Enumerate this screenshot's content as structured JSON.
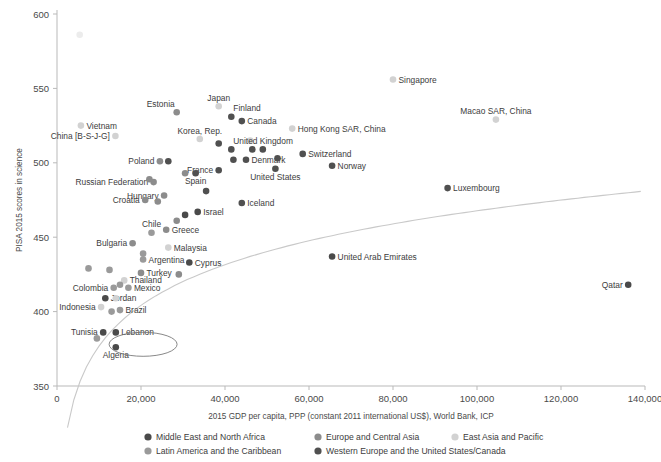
{
  "chart_data": {
    "type": "scatter",
    "title": "",
    "xlabel": "2015 GDP per capita, PPP (constant 2011 international US$), World Bank, ICP",
    "ylabel": "PISA 2015 scores in science",
    "xlim": [
      0,
      140000
    ],
    "ylim": [
      350,
      600
    ],
    "xticks": [
      "0",
      "20,000",
      "40,000",
      "60,000",
      "80,000",
      "100,000",
      "120,000",
      "140,000"
    ],
    "xtick_values": [
      0,
      20000,
      40000,
      60000,
      80000,
      100000,
      120000,
      140000
    ],
    "yticks": [
      "350",
      "400",
      "450",
      "500",
      "550",
      "600"
    ],
    "ytick_values": [
      350,
      400,
      450,
      500,
      550,
      600
    ],
    "grid": false,
    "legend_position": "bottom",
    "has_trendline": true,
    "trendline_note": "logarithmic fit curve rising from lower-left to upper-right",
    "annotation_ellipse": {
      "label": "Lebanon",
      "x": 20500,
      "y": 378
    },
    "series": [
      {
        "name": "Middle East and North Africa",
        "color": "#4a4a4a"
      },
      {
        "name": "Latin America and the Caribbean",
        "color": "#9a9a9a"
      },
      {
        "name": "Europe and Central Asia",
        "color": "#8c8c8c"
      },
      {
        "name": "Western Europe and the United States/Canada",
        "color": "#505050"
      },
      {
        "name": "East Asia and Pacific",
        "color": "#d2d2d2"
      }
    ],
    "points": [
      {
        "label": "",
        "x": 5400,
        "y": 586,
        "group": "East Asia and Pacific",
        "label_pos": "none"
      },
      {
        "label": "Singapore",
        "x": 80000,
        "y": 556,
        "group": "East Asia and Pacific",
        "label_pos": "right"
      },
      {
        "label": "Japan",
        "x": 38500,
        "y": 538,
        "group": "East Asia and Pacific",
        "label_pos": "above"
      },
      {
        "label": "Estonia",
        "x": 28500,
        "y": 534,
        "group": "Europe and Central Asia",
        "label_pos": "above-left"
      },
      {
        "label": "Finland",
        "x": 41500,
        "y": 531,
        "group": "Western Europe and the United States/Canada",
        "label_pos": "above-right"
      },
      {
        "label": "Macao SAR, China",
        "x": 104500,
        "y": 529,
        "group": "East Asia and Pacific",
        "label_pos": "above"
      },
      {
        "label": "Canada",
        "x": 44000,
        "y": 528,
        "group": "Western Europe and the United States/Canada",
        "label_pos": "right"
      },
      {
        "label": "Vietnam",
        "x": 5700,
        "y": 525,
        "group": "East Asia and Pacific",
        "label_pos": "right"
      },
      {
        "label": "Hong Kong SAR, China",
        "x": 56000,
        "y": 523,
        "group": "East Asia and Pacific",
        "label_pos": "right"
      },
      {
        "label": "China [B-S-J-G]",
        "x": 13900,
        "y": 518,
        "group": "East Asia and Pacific",
        "label_pos": "left"
      },
      {
        "label": "Korea, Rep.",
        "x": 34000,
        "y": 516,
        "group": "East Asia and Pacific",
        "label_pos": "above"
      },
      {
        "label": "Taipei",
        "x": 46000,
        "y": 515,
        "group": "East Asia and Pacific",
        "label_pos": "none"
      },
      {
        "label": "",
        "x": 38500,
        "y": 513,
        "group": "Western Europe and the United States/Canada",
        "label_pos": "none"
      },
      {
        "label": "United Kingdom",
        "x": 41500,
        "y": 509,
        "group": "Western Europe and the United States/Canada",
        "label_pos": "above-right"
      },
      {
        "label": "Switzerland",
        "x": 58500,
        "y": 506,
        "group": "Western Europe and the United States/Canada",
        "label_pos": "right"
      },
      {
        "label": "",
        "x": 46500,
        "y": 509,
        "group": "Western Europe and the United States/Canada",
        "label_pos": "none"
      },
      {
        "label": "",
        "x": 49000,
        "y": 509,
        "group": "Western Europe and the United States/Canada",
        "label_pos": "none"
      },
      {
        "label": "Poland",
        "x": 24500,
        "y": 501,
        "group": "Europe and Central Asia",
        "label_pos": "left"
      },
      {
        "label": "",
        "x": 26500,
        "y": 501,
        "group": "Western Europe and the United States/Canada",
        "label_pos": "none"
      },
      {
        "label": "Denmark",
        "x": 45000,
        "y": 502,
        "group": "Western Europe and the United States/Canada",
        "label_pos": "right"
      },
      {
        "label": "",
        "x": 42000,
        "y": 502,
        "group": "Western Europe and the United States/Canada",
        "label_pos": "none"
      },
      {
        "label": "",
        "x": 52500,
        "y": 503,
        "group": "Western Europe and the United States/Canada",
        "label_pos": "none"
      },
      {
        "label": "Norway",
        "x": 65500,
        "y": 498,
        "group": "Western Europe and the United States/Canada",
        "label_pos": "right"
      },
      {
        "label": "France",
        "x": 38500,
        "y": 495,
        "group": "Western Europe and the United States/Canada",
        "label_pos": "left"
      },
      {
        "label": "United States",
        "x": 52000,
        "y": 496,
        "group": "Western Europe and the United States/Canada",
        "label_pos": "below"
      },
      {
        "label": "Spain",
        "x": 33000,
        "y": 493,
        "group": "Western Europe and the United States/Canada",
        "label_pos": "below"
      },
      {
        "label": "",
        "x": 30500,
        "y": 493,
        "group": "Europe and Central Asia",
        "label_pos": "none"
      },
      {
        "label": "Russian Federation",
        "x": 23000,
        "y": 487,
        "group": "Europe and Central Asia",
        "label_pos": "left"
      },
      {
        "label": "",
        "x": 22000,
        "y": 489,
        "group": "Europe and Central Asia",
        "label_pos": "none"
      },
      {
        "label": "Hungary",
        "x": 25500,
        "y": 478,
        "group": "Europe and Central Asia",
        "label_pos": "left"
      },
      {
        "label": "",
        "x": 35500,
        "y": 481,
        "group": "Western Europe and the United States/Canada",
        "label_pos": "none"
      },
      {
        "label": "Croatia",
        "x": 21000,
        "y": 475,
        "group": "Europe and Central Asia",
        "label_pos": "left"
      },
      {
        "label": "",
        "x": 24000,
        "y": 474,
        "group": "Europe and Central Asia",
        "label_pos": "none"
      },
      {
        "label": "Iceland",
        "x": 44000,
        "y": 473,
        "group": "Western Europe and the United States/Canada",
        "label_pos": "right"
      },
      {
        "label": "Israel",
        "x": 33500,
        "y": 467,
        "group": "Middle East and North Africa",
        "label_pos": "right"
      },
      {
        "label": "",
        "x": 30500,
        "y": 465,
        "group": "Middle East and North Africa",
        "label_pos": "none"
      },
      {
        "label": "",
        "x": 28500,
        "y": 461,
        "group": "Europe and Central Asia",
        "label_pos": "none"
      },
      {
        "label": "Greece",
        "x": 26000,
        "y": 455,
        "group": "Europe and Central Asia",
        "label_pos": "right"
      },
      {
        "label": "Chile",
        "x": 22500,
        "y": 453,
        "group": "Latin America and the Caribbean",
        "label_pos": "above"
      },
      {
        "label": "Bulgaria",
        "x": 18000,
        "y": 446,
        "group": "Europe and Central Asia",
        "label_pos": "left"
      },
      {
        "label": "Malaysia",
        "x": 26500,
        "y": 443,
        "group": "East Asia and Pacific",
        "label_pos": "right"
      },
      {
        "label": "Argentina",
        "x": 20500,
        "y": 435,
        "group": "Latin America and the Caribbean",
        "label_pos": "right"
      },
      {
        "label": "",
        "x": 20500,
        "y": 439,
        "group": "Latin America and the Caribbean",
        "label_pos": "none"
      },
      {
        "label": "Cyprus",
        "x": 31500,
        "y": 433,
        "group": "Middle East and North Africa",
        "label_pos": "right"
      },
      {
        "label": "Turkey",
        "x": 20000,
        "y": 426,
        "group": "Europe and Central Asia",
        "label_pos": "right"
      },
      {
        "label": "",
        "x": 29000,
        "y": 425,
        "group": "Europe and Central Asia",
        "label_pos": "none"
      },
      {
        "label": "",
        "x": 7500,
        "y": 429,
        "group": "Latin America and the Caribbean",
        "label_pos": "none"
      },
      {
        "label": "",
        "x": 12500,
        "y": 428,
        "group": "Latin America and the Caribbean",
        "label_pos": "none"
      },
      {
        "label": "Colombia",
        "x": 13500,
        "y": 416,
        "group": "Latin America and the Caribbean",
        "label_pos": "left"
      },
      {
        "label": "Thailand",
        "x": 16000,
        "y": 421,
        "group": "East Asia and Pacific",
        "label_pos": "right"
      },
      {
        "label": "",
        "x": 15000,
        "y": 418,
        "group": "Latin America and the Caribbean",
        "label_pos": "none"
      },
      {
        "label": "Mexico",
        "x": 17000,
        "y": 416,
        "group": "Latin America and the Caribbean",
        "label_pos": "right"
      },
      {
        "label": "Jordan",
        "x": 11500,
        "y": 409,
        "group": "Middle East and North Africa",
        "label_pos": "right"
      },
      {
        "label": "",
        "x": 14000,
        "y": 409,
        "group": "East Asia and Pacific",
        "label_pos": "none"
      },
      {
        "label": "Indonesia",
        "x": 10500,
        "y": 403,
        "group": "East Asia and Pacific",
        "label_pos": "left"
      },
      {
        "label": "Brazil",
        "x": 15000,
        "y": 401,
        "group": "Latin America and the Caribbean",
        "label_pos": "right"
      },
      {
        "label": "",
        "x": 13000,
        "y": 400,
        "group": "Latin America and the Caribbean",
        "label_pos": "none"
      },
      {
        "label": "Tunisia",
        "x": 11000,
        "y": 386,
        "group": "Middle East and North Africa",
        "label_pos": "left"
      },
      {
        "label": "Lebanon",
        "x": 14000,
        "y": 386,
        "group": "Middle East and North Africa",
        "label_pos": "right"
      },
      {
        "label": "",
        "x": 9500,
        "y": 382,
        "group": "Latin America and the Caribbean",
        "label_pos": "none"
      },
      {
        "label": "Algeria",
        "x": 14000,
        "y": 376,
        "group": "Middle East and North Africa",
        "label_pos": "below"
      },
      {
        "label": "Luxembourg",
        "x": 93000,
        "y": 483,
        "group": "Western Europe and the United States/Canada",
        "label_pos": "right"
      },
      {
        "label": "United Arab Emirates",
        "x": 65500,
        "y": 437,
        "group": "Middle East and North Africa",
        "label_pos": "right"
      },
      {
        "label": "Qatar",
        "x": 136000,
        "y": 418,
        "group": "Middle East and North Africa",
        "label_pos": "left"
      }
    ]
  },
  "legend": {
    "items": [
      {
        "label": "Middle East and North Africa",
        "color": "#4a4a4a"
      },
      {
        "label": "Europe and Central Asia",
        "color": "#8c8c8c"
      },
      {
        "label": "East Asia and Pacific",
        "color": "#d2d2d2"
      },
      {
        "label": "Latin America and the Caribbean",
        "color": "#9a9a9a"
      },
      {
        "label": "Western Europe and the United States/Canada",
        "color": "#505050"
      }
    ]
  }
}
